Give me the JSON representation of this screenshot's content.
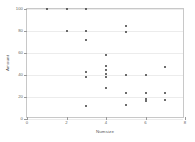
{
  "chart_data": {
    "type": "scatter",
    "title": "",
    "xlabel": "Numsize",
    "ylabel": "Amount",
    "xlim": [
      0,
      8
    ],
    "ylim": [
      0,
      100
    ],
    "xticks": [
      0,
      2,
      4,
      6,
      8
    ],
    "yticks": [
      0,
      20,
      40,
      60,
      80,
      100
    ],
    "xtick_labels": [
      "0",
      "2",
      "4",
      "6",
      "8"
    ],
    "ytick_labels": [
      "0",
      "20",
      "40",
      "60",
      "80",
      "100"
    ],
    "grid": true,
    "grid_axis": "y",
    "legend": false,
    "marker_color": "#3b3b3b",
    "grid_color": "#ececec",
    "frame_color": "#c8c8c8",
    "background": "#ffffff",
    "points": [
      {
        "x": 1,
        "y": 100
      },
      {
        "x": 2,
        "y": 100
      },
      {
        "x": 3,
        "y": 100
      },
      {
        "x": 2,
        "y": 80
      },
      {
        "x": 3,
        "y": 80
      },
      {
        "x": 3,
        "y": 72
      },
      {
        "x": 5,
        "y": 85
      },
      {
        "x": 5,
        "y": 79
      },
      {
        "x": 4,
        "y": 58
      },
      {
        "x": 3,
        "y": 43
      },
      {
        "x": 3,
        "y": 38
      },
      {
        "x": 4,
        "y": 48
      },
      {
        "x": 4,
        "y": 45
      },
      {
        "x": 4,
        "y": 41
      },
      {
        "x": 4,
        "y": 38
      },
      {
        "x": 5,
        "y": 40
      },
      {
        "x": 6,
        "y": 40
      },
      {
        "x": 7,
        "y": 47
      },
      {
        "x": 4,
        "y": 28
      },
      {
        "x": 5,
        "y": 24
      },
      {
        "x": 6,
        "y": 24
      },
      {
        "x": 7,
        "y": 24
      },
      {
        "x": 6,
        "y": 18
      },
      {
        "x": 6,
        "y": 16
      },
      {
        "x": 7,
        "y": 17
      },
      {
        "x": 5,
        "y": 13
      },
      {
        "x": 3,
        "y": 12
      }
    ]
  }
}
